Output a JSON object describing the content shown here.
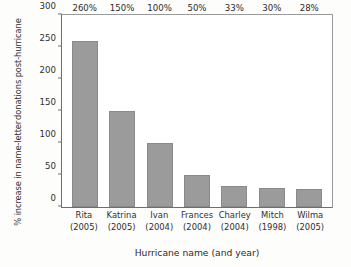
{
  "chart_data": {
    "type": "bar",
    "title": "",
    "xlabel": "Hurricane name (and year)",
    "ylabel_lines": [
      "% increase in name-letter",
      "donations post-hurricane"
    ],
    "ylabel": "% increase in name-letter donations post-hurricane",
    "categories": [
      "Rita",
      "Katrina",
      "Ivan",
      "Frances",
      "Charley",
      "Mitch",
      "Wilma"
    ],
    "category_years": [
      "(2005)",
      "(2005)",
      "(2004)",
      "(2004)",
      "(2004)",
      "(1998)",
      "(2005)"
    ],
    "values": [
      260,
      150,
      100,
      50,
      33,
      30,
      28
    ],
    "value_labels": [
      "260%",
      "150%",
      "100%",
      "50%",
      "33%",
      "30%",
      "28%"
    ],
    "ylim": [
      0,
      300
    ],
    "yticks": [
      0,
      50,
      100,
      150,
      200,
      250,
      300
    ],
    "ytick_labels": [
      "0",
      "50",
      "100",
      "150",
      "200",
      "250",
      "300"
    ],
    "grid": false,
    "legend": null,
    "bar_color": "#9b9b9b",
    "bar_edge_color": "#8a8a8a",
    "axis_color": "#6e6e6e",
    "text_color": "#2b2b2b",
    "background_color": "#ffffff"
  }
}
